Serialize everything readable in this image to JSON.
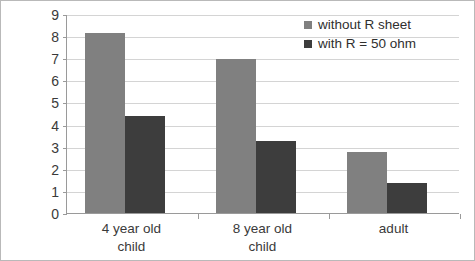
{
  "chart_data": {
    "type": "bar",
    "title": "",
    "xlabel": "",
    "ylabel": "",
    "categories": [
      "4 year old child",
      "8 year old child",
      "adult"
    ],
    "category_lines": [
      [
        "4 year old",
        "child"
      ],
      [
        "8 year old",
        "child"
      ],
      [
        "adult"
      ]
    ],
    "series": [
      {
        "name": "without R sheet",
        "color": "#808080",
        "values": [
          8.15,
          6.95,
          2.78
        ]
      },
      {
        "name": "with R = 50 ohm",
        "color": "#3d3d3d",
        "values": [
          4.4,
          3.25,
          1.35
        ]
      }
    ],
    "ylim": [
      0,
      9
    ],
    "ytick_step": 1,
    "yticks": [
      "0",
      "1",
      "2",
      "3",
      "4",
      "5",
      "6",
      "7",
      "8",
      "9"
    ],
    "grid": true,
    "legend_position": "top-right"
  },
  "legend": {
    "items": [
      {
        "label": "without R sheet",
        "swatch": "legend-swatch-without-r-sheet"
      },
      {
        "label": "with R = 50 ohm",
        "swatch": "legend-swatch-with-r-50-ohm"
      }
    ]
  },
  "colors": {
    "series_light": "#808080",
    "series_dark": "#3d3d3d",
    "gridline": "#d4d4d4",
    "axis": "#9a9a9a",
    "frame": "#b9b9b9",
    "text": "#3a3a3a",
    "background": "#ffffff"
  }
}
